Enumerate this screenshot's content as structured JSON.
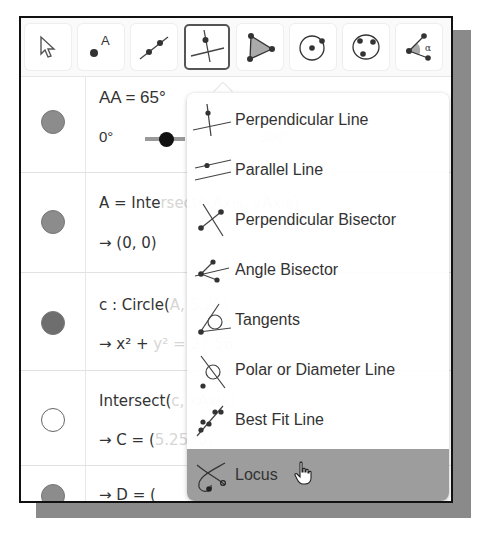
{
  "toolbar": {
    "tools": [
      {
        "name": "Move",
        "icon": "arrow-cursor-icon"
      },
      {
        "name": "Point",
        "icon": "point-icon",
        "label": "A"
      },
      {
        "name": "Line",
        "icon": "line-through-points-icon"
      },
      {
        "name": "Perpendicular Line",
        "icon": "perpendicular-line-icon",
        "active": true
      },
      {
        "name": "Polygon",
        "icon": "polygon-icon"
      },
      {
        "name": "Circle with Center",
        "icon": "circle-center-icon"
      },
      {
        "name": "Circle through 3 Points",
        "icon": "circle-three-points-icon"
      },
      {
        "name": "Angle",
        "icon": "angle-icon",
        "label": "α"
      }
    ]
  },
  "algebra": {
    "rows": [
      {
        "line1": "AA = 65°",
        "slider_min": "0°",
        "slider_max": "360°",
        "dot": "filled"
      },
      {
        "line1": "A = Intersect(xAxis, yAxis)",
        "line1_visible": "A = Inte",
        "line1_hidden": "rsect(xAxis, yAxis)",
        "line2": "→ (0, 0)",
        "dot": "filled"
      },
      {
        "line1": "c : Circle(A, 5.25)",
        "line1_visible": "c : Circle(",
        "line1_hidden": "A, 5.25)",
        "line2_visible": "→ x² +",
        "line2_hidden": "y² = 27.56",
        "dot": "dark"
      },
      {
        "line1": "Intersect(c, xAxis)",
        "line1_visible": "Intersect(",
        "line1_hidden": "c, xAxis)",
        "line2_visible": "→ C = (",
        "line2_hidden": "5.25, 0)",
        "dot": "empty"
      },
      {
        "line1_visible": "→ D = (",
        "dot": "filled"
      }
    ]
  },
  "menu": {
    "items": [
      {
        "label": "Perpendicular Line",
        "icon": "perpendicular-line-icon"
      },
      {
        "label": "Parallel Line",
        "icon": "parallel-line-icon"
      },
      {
        "label": "Perpendicular Bisector",
        "icon": "perpendicular-bisector-icon"
      },
      {
        "label": "Angle Bisector",
        "icon": "angle-bisector-icon"
      },
      {
        "label": "Tangents",
        "icon": "tangents-icon"
      },
      {
        "label": "Polar or Diameter Line",
        "icon": "polar-line-icon"
      },
      {
        "label": "Best Fit Line",
        "icon": "best-fit-line-icon"
      },
      {
        "label": "Locus",
        "icon": "locus-icon",
        "hovered": true
      }
    ]
  },
  "colors": {
    "hover_bg": "#9d9d9d",
    "frame": "#111111",
    "dot": "#8c8c8c"
  }
}
